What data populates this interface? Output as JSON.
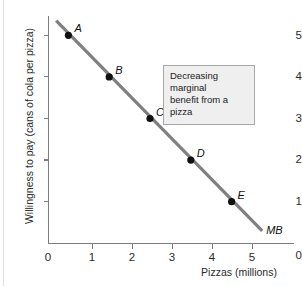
{
  "chart_data": {
    "type": "line",
    "title": "",
    "xlabel": "Pizzas (millions)",
    "ylabel": "Willingness to pay (cans of cola per pizza)",
    "xlim": [
      0,
      5.6
    ],
    "ylim": [
      0,
      5.6
    ],
    "xticks": [
      "0",
      "1",
      "2",
      "3",
      "4",
      "5"
    ],
    "xtick_values": [
      0,
      1,
      2,
      3,
      4,
      5
    ],
    "yticks": [
      "0",
      "1",
      "2",
      "3",
      "4",
      "5"
    ],
    "ytick_values": [
      0,
      1,
      2,
      3,
      4,
      5
    ],
    "grid": false,
    "legend": null,
    "series": [
      {
        "name": "MB",
        "label": "MB",
        "color": "#808080",
        "line_from": [
          0.2,
          5.35
        ],
        "line_to": [
          5.25,
          0.3
        ],
        "points": [
          {
            "label": "A",
            "x": 0.5,
            "y": 5
          },
          {
            "label": "B",
            "x": 1.5,
            "y": 4
          },
          {
            "label": "C",
            "x": 2.5,
            "y": 3
          },
          {
            "label": "D",
            "x": 3.5,
            "y": 2
          },
          {
            "label": "E",
            "x": 4.5,
            "y": 1
          }
        ]
      }
    ],
    "annotations": [
      {
        "name": "decreasing-marginal-benefit",
        "line1": "Decreasing marginal",
        "line2": "benefit from a pizza"
      }
    ],
    "colors": {
      "line": "#808080",
      "point": "#111111",
      "axis": "#7d7d7d",
      "annotation_bg": "#efefef",
      "annotation_border": "#a8a8a8"
    }
  }
}
